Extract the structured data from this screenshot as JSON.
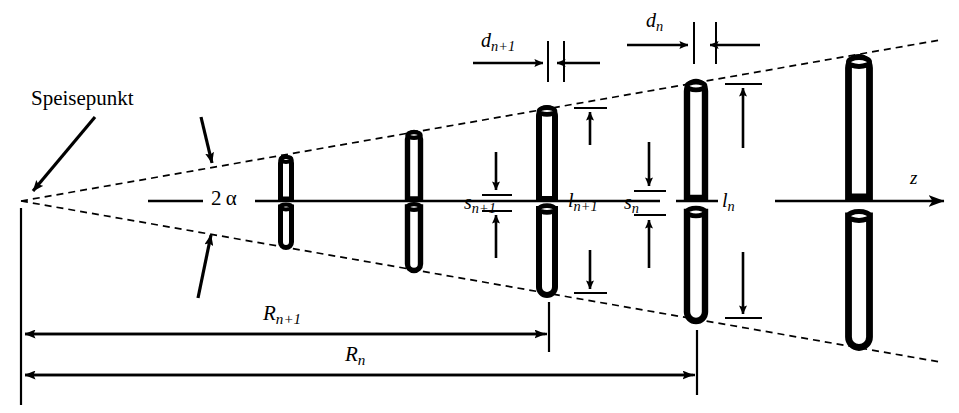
{
  "diagram": {
    "type": "technical-line-diagram",
    "background_color": "#ffffff",
    "line_color": "#000000",
    "language": "de"
  },
  "labels": {
    "feed_point": "Speisepunkt",
    "apex_angle": "2 α",
    "axis_z": "z",
    "spacing_n_plus_1": {
      "base": "d",
      "sub": "n+1"
    },
    "spacing_n": {
      "base": "d",
      "sub": "n"
    },
    "gap_n_plus_1": {
      "base": "s",
      "sub": "n+1"
    },
    "gap_n": {
      "base": "s",
      "sub": "n"
    },
    "length_n_plus_1": {
      "base": "l",
      "sub": "n+1"
    },
    "length_n": {
      "base": "l",
      "sub": "n"
    },
    "radius_n_plus_1": {
      "base": "R",
      "sub": "n+1"
    },
    "radius_n": {
      "base": "R",
      "sub": "n"
    }
  },
  "geometry": {
    "apex": {
      "x": 20,
      "y": 201
    },
    "axis_y": 201,
    "envelope_upper_end": {
      "x": 940,
      "y": 40
    },
    "envelope_lower_end": {
      "x": 940,
      "y": 362
    },
    "axis_arrow_end_x": 950,
    "elements": [
      {
        "name": "dipole-1",
        "x": 286,
        "half_length": 46,
        "cap_width": 13
      },
      {
        "name": "dipole-2",
        "x": 414,
        "half_length": 68,
        "cap_width": 15
      },
      {
        "name": "dipole-n-plus-1",
        "x": 547,
        "half_length": 93,
        "cap_width": 18
      },
      {
        "name": "dipole-n",
        "x": 696,
        "half_length": 119,
        "cap_width": 20
      },
      {
        "name": "dipole-last",
        "x": 859,
        "half_length": 167,
        "cap_width": 23
      }
    ],
    "R_n_plus_1_line_y": 334,
    "R_n_line_y": 375,
    "left_datum_x": 21
  },
  "annotations": [
    {
      "name": "feed-point-arrow",
      "from": [
        95,
        118
      ],
      "to": [
        30,
        193
      ]
    },
    {
      "name": "upper-envelope-arrow",
      "from": [
        200,
        118
      ],
      "to": [
        212,
        167
      ]
    },
    {
      "name": "lower-envelope-arrow",
      "from": [
        198,
        300
      ],
      "to": [
        210,
        232
      ]
    }
  ]
}
